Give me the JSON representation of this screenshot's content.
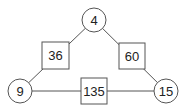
{
  "diagram": {
    "type": "triangle-number-puzzle",
    "nodes": [
      {
        "id": "top",
        "value": "4",
        "shape": "circle"
      },
      {
        "id": "left",
        "value": "9",
        "shape": "circle"
      },
      {
        "id": "right",
        "value": "15",
        "shape": "circle"
      }
    ],
    "edges": [
      {
        "id": "top-left",
        "from": "top",
        "to": "left",
        "value": "36",
        "shape": "square"
      },
      {
        "id": "top-right",
        "from": "top",
        "to": "right",
        "value": "60",
        "shape": "square"
      },
      {
        "id": "left-right",
        "from": "left",
        "to": "right",
        "value": "135",
        "shape": "square"
      }
    ]
  }
}
